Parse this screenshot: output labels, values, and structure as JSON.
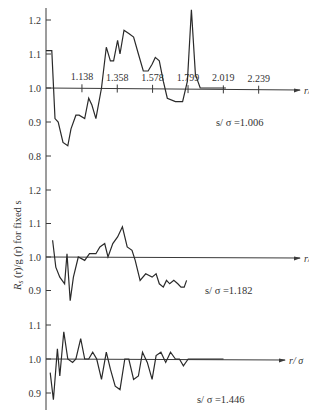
{
  "chart_data": {
    "type": "line",
    "ylabel": "R_s(r)/g(r) for fixed s",
    "xlabel": "r/σ",
    "x_ticks": [
      1.138,
      1.358,
      1.578,
      1.799,
      2.019,
      2.239
    ],
    "x_tick_labels": [
      "1.138",
      "1.358",
      "1.578",
      "1.799",
      "2.019",
      "2.239"
    ],
    "grid": false,
    "panels": [
      {
        "label": "s/σ = 1.006",
        "y_ticks": [
          1.2,
          1.1,
          1.0,
          0.9,
          0.8
        ],
        "y_tick_labels": [
          "1.2",
          "1.1",
          "1.0",
          "0.9",
          "0.8"
        ],
        "ylim": [
          0.78,
          1.23
        ],
        "x": [
          0.914,
          0.95,
          0.97,
          0.99,
          1.02,
          1.05,
          1.07,
          1.1,
          1.12,
          1.155,
          1.18,
          1.2,
          1.225,
          1.26,
          1.29,
          1.315,
          1.335,
          1.36,
          1.375,
          1.4,
          1.43,
          1.46,
          1.49,
          1.52,
          1.55,
          1.575,
          1.595,
          1.62,
          1.645,
          1.67,
          1.72,
          1.765,
          1.795,
          1.82,
          1.845,
          1.875,
          1.905,
          1.93,
          1.96,
          1.985,
          2.005,
          2.035
        ],
        "y": [
          1.11,
          1.11,
          0.91,
          0.9,
          0.84,
          0.83,
          0.88,
          0.92,
          0.92,
          0.91,
          0.97,
          0.95,
          0.91,
          1.0,
          1.12,
          1.08,
          1.08,
          1.14,
          1.1,
          1.17,
          1.16,
          1.15,
          1.1,
          1.05,
          1.05,
          1.07,
          1.09,
          1.08,
          1.02,
          0.97,
          0.96,
          0.96,
          1.02,
          1.23,
          1.04,
          1.0,
          1.0,
          1.0,
          1.0,
          1.0,
          1.0,
          1.0
        ],
        "y_values_note": "traced approximately from plot"
      },
      {
        "label": "s/σ = 1.182",
        "y_ticks": [
          1.2,
          1.1,
          1.0,
          0.9
        ],
        "y_tick_labels": [
          "1.2",
          "1.1",
          "1.0",
          "0.9"
        ],
        "ylim": [
          0.88,
          1.22
        ],
        "x": [
          0.955,
          0.975,
          1.0,
          1.03,
          1.045,
          1.065,
          1.085,
          1.115,
          1.155,
          1.185,
          1.225,
          1.25,
          1.28,
          1.3,
          1.33,
          1.36,
          1.39,
          1.42,
          1.45,
          1.47,
          1.5,
          1.535,
          1.575,
          1.6,
          1.62,
          1.645,
          1.665,
          1.685,
          1.71,
          1.735,
          1.755,
          1.775,
          1.79
        ],
        "y": [
          1.05,
          0.97,
          0.94,
          0.92,
          1.01,
          0.87,
          0.94,
          1.0,
          0.99,
          1.01,
          1.01,
          1.03,
          1.04,
          1.0,
          1.04,
          1.06,
          1.09,
          1.03,
          1.02,
          0.99,
          0.93,
          0.95,
          0.94,
          0.95,
          0.92,
          0.91,
          0.93,
          0.92,
          0.93,
          0.92,
          0.91,
          0.91,
          0.93
        ],
        "y_values_note": "traced approximately from plot"
      },
      {
        "label": "s/σ = 1.446",
        "y_ticks": [
          1.1,
          1.0,
          0.9
        ],
        "y_tick_labels": [
          "1.1",
          "1.0",
          "0.9"
        ],
        "ylim": [
          0.86,
          1.12
        ],
        "x": [
          0.94,
          0.96,
          0.985,
          1.0,
          1.025,
          1.05,
          1.08,
          1.1,
          1.13,
          1.155,
          1.18,
          1.205,
          1.23,
          1.26,
          1.29,
          1.315,
          1.345,
          1.375,
          1.405,
          1.43,
          1.46,
          1.49,
          1.515,
          1.545,
          1.575,
          1.6,
          1.63,
          1.66,
          1.69,
          1.72,
          1.745,
          1.77,
          1.8,
          1.83,
          1.86,
          1.885,
          1.91,
          1.94,
          1.965,
          1.99,
          2.02
        ],
        "y": [
          0.96,
          0.88,
          1.03,
          0.95,
          1.08,
          1.0,
          0.99,
          1.0,
          1.06,
          1.0,
          1.0,
          1.02,
          1.0,
          0.94,
          1.02,
          0.97,
          0.92,
          0.91,
          1.0,
          1.0,
          0.94,
          0.95,
          1.02,
          0.99,
          0.94,
          1.01,
          1.02,
          0.99,
          1.02,
          1.0,
          1.0,
          0.98,
          1.0,
          1.0,
          1.0,
          1.0,
          1.0,
          1.0,
          1.0,
          1.0,
          1.0
        ]
      }
    ]
  },
  "labels": {
    "ylabel_main": "R",
    "ylabel_sub": "s",
    "ylabel_rest": " (r)/g (r) for fixed s",
    "xaxis_label": "r/ σ",
    "panel1_annot": "s/ σ  =1.006",
    "panel2_annot": "s/ σ  =1.182",
    "panel3_annot": "s/ σ  =1.446"
  },
  "colors": {
    "line": "#2a2a2a",
    "axis": "#3a3a3a",
    "background": "#ffffff"
  }
}
